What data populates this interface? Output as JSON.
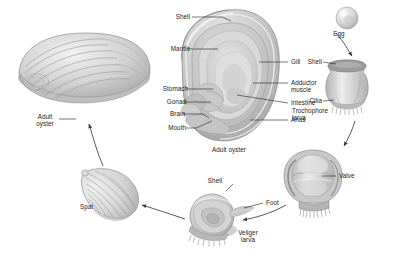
{
  "diagram": {
    "background_color": "#ffffff",
    "label_color": "#1a1a1a",
    "line_color": "#4a4a4a"
  },
  "anatomy_labels_left": [
    {
      "text": "Shell",
      "name": "label-shell"
    },
    {
      "text": "Mantle",
      "name": "label-mantle"
    },
    {
      "text": "Stomach",
      "name": "label-stomach"
    },
    {
      "text": "Gonad",
      "name": "label-gonad"
    },
    {
      "text": "Brain",
      "name": "label-brain"
    },
    {
      "text": "Mouth",
      "name": "label-mouth"
    }
  ],
  "anatomy_labels_right": [
    {
      "text": "Gill",
      "name": "label-gill"
    },
    {
      "text": "Adductor",
      "name": "label-adductor-muscle-line1"
    },
    {
      "text": "muscle",
      "name": "label-adductor-muscle-line2"
    },
    {
      "text": "Intestine",
      "name": "label-intestine"
    },
    {
      "text": "Anus",
      "name": "label-anus"
    }
  ],
  "stage_labels": {
    "adult_oyster_left_line1": "Adult",
    "adult_oyster_left_line2": "oyster",
    "adult_oyster_center": "Adult oyster",
    "egg": "Egg",
    "trochophore_shell": "Shell",
    "trochophore_cilia": "Cilia",
    "trochophore_line1": "Trochophore",
    "trochophore_line2": "larva",
    "valve": "Valve",
    "veliger_shell": "Shell",
    "veliger_foot": "Foot",
    "veliger_line1": "Veliger",
    "veliger_line2": "larva",
    "spat": "Spat"
  }
}
